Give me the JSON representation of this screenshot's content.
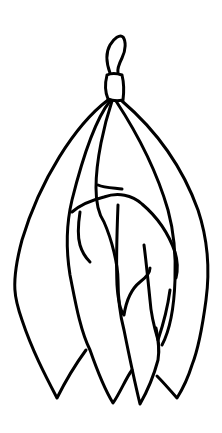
{
  "image": {
    "description": "Line drawing of a tied bundle of folded fabric strips hanging from a knot",
    "background_color": "#ffffff",
    "stroke_color": "#000000",
    "elements": [
      "knot-loop",
      "knot-band",
      "fabric-strips"
    ]
  }
}
